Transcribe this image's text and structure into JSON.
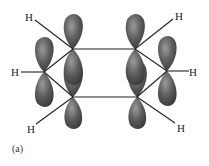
{
  "diagram": {
    "caption": "(a)",
    "atom_label": "H",
    "hydrogens": [
      {
        "label": "H",
        "x": 28,
        "y": 19
      },
      {
        "label": "H",
        "x": 178,
        "y": 18
      },
      {
        "label": "H",
        "x": 14,
        "y": 75
      },
      {
        "label": "H",
        "x": 193,
        "y": 75
      },
      {
        "label": "H",
        "x": 30,
        "y": 131
      },
      {
        "label": "H",
        "x": 180,
        "y": 130
      }
    ],
    "carbons": [
      {
        "x": 73,
        "y": 49
      },
      {
        "x": 135,
        "y": 49
      },
      {
        "x": 167,
        "y": 71
      },
      {
        "x": 137,
        "y": 97
      },
      {
        "x": 73,
        "y": 97
      },
      {
        "x": 44,
        "y": 72
      }
    ],
    "colors": {
      "orbital": "#5a5a5a",
      "orbital_highlight": "#8a8a8a",
      "bond": "#222222",
      "background": "#ffffff"
    }
  }
}
